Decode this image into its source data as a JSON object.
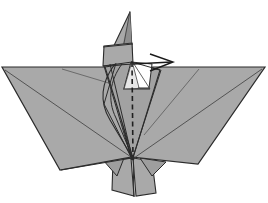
{
  "figure": {
    "model_name": "winged figure / butterfly base",
    "caption": "",
    "canvas": {
      "width": 268,
      "height": 203,
      "background": "#ffffff"
    },
    "palette": {
      "paper_front": "#a9a9a9",
      "paper_front_alt": "#a2a2a2",
      "paper_shade_dark": "#8e8e8e",
      "paper_shade_darker": "#848484",
      "paper_back_white": "#ffffff",
      "outline": "#2b2b2b",
      "crease_line": "#3a3a3a",
      "fold_dashed": "#1f1f1f",
      "arrow": "#1a1a1a",
      "background": "#ffffff"
    },
    "elements": [
      {
        "name": "left-wing",
        "type": "filled-polygon",
        "label": "Left wing panel"
      },
      {
        "name": "right-wing",
        "type": "filled-polygon",
        "label": "Right wing panel"
      },
      {
        "name": "center-body",
        "type": "filled-polygon",
        "label": "Central body panel"
      },
      {
        "name": "top-spike",
        "type": "filled-polygon",
        "label": "Upper point / head spike"
      },
      {
        "name": "head-box",
        "type": "filled-polygon",
        "label": "Folded head flap"
      },
      {
        "name": "white-pocket",
        "type": "filled-polygon",
        "label": "White underside pocket"
      },
      {
        "name": "left-leg",
        "type": "filled-polygon",
        "label": "Left lower leg"
      },
      {
        "name": "right-leg",
        "type": "filled-polygon",
        "label": "Right lower leg"
      },
      {
        "name": "center-fold-dashed",
        "type": "dashed-line",
        "label": "Valley fold axis (dashed)"
      },
      {
        "name": "fold-arrow",
        "type": "arrow",
        "label": "Fold direction arrow pointing right"
      },
      {
        "name": "crease-lines",
        "type": "line-group",
        "label": "Crease / edge reference lines"
      }
    ],
    "annotations": {
      "arrow_direction": "right",
      "arrow_count": 1,
      "dashed_axis": "vertical-center"
    },
    "geometry": {
      "left_wing_points": "2,67 108,67 131,157 60,170",
      "right_wing_points": "132,157 137,67 265,67 198,164",
      "center_body_points": "105,67 132,63 160,70 133,158",
      "top_spike_points": "130,12 132,50 108,58",
      "top_spike_shade_points": "130,12 132,50 121,52",
      "head_box_points": "104,46 132,43 133,64 103,66",
      "white_pocket_points": "131,62 152,64 149,88 124,88",
      "left_leg_points": "113,160 131,158 134,196 112,190",
      "right_leg_points": "133,158 152,161 156,193 136,196",
      "leg_gusset_left": "103,160 124,158 117,176",
      "leg_gusset_right": "140,158 166,162 152,176",
      "dashed_axis_x": 132,
      "dashed_axis_y1": 62,
      "dashed_axis_y2": 160,
      "arrow_tail": [
        138,
        66
      ],
      "arrow_head": [
        172,
        62
      ]
    }
  }
}
